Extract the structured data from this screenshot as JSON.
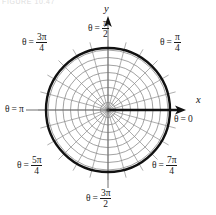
{
  "figure": {
    "title_fragment": "FIGURE 10.47",
    "colors": {
      "grid": "#8a8a8a",
      "bold_curve": "#111111",
      "axis": "#111111",
      "background": "#ffffff",
      "text": "#1a1a1a"
    }
  },
  "axes": {
    "x_letter": "x",
    "y_letter": "y"
  },
  "labels": {
    "theta_symbol": "θ",
    "equals": "=",
    "pi": "π",
    "theta_0": {
      "name": "theta-zero",
      "value": "0",
      "kind": "plain"
    },
    "theta_pi_over_4": {
      "name": "theta-pi-over-4",
      "num": "π",
      "den": "4",
      "kind": "fraction"
    },
    "theta_pi_over_2": {
      "name": "theta-pi-over-2",
      "num": "π",
      "den": "2",
      "kind": "fraction"
    },
    "theta_3pi_over_4": {
      "name": "theta-three-pi-over-4",
      "num": "3π",
      "den": "4",
      "kind": "fraction"
    },
    "theta_pi": {
      "name": "theta-pi",
      "value": "π",
      "kind": "plain"
    },
    "theta_5pi_over_4": {
      "name": "theta-five-pi-over-4",
      "num": "5π",
      "den": "4",
      "kind": "fraction"
    },
    "theta_3pi_over_2": {
      "name": "theta-three-pi-over-2",
      "num": "3π",
      "den": "2",
      "kind": "fraction"
    },
    "theta_7pi_over_4": {
      "name": "theta-seven-pi-over-4",
      "num": "7π",
      "den": "4",
      "kind": "fraction"
    }
  },
  "chart_data": {
    "type": "line",
    "subtype": "polar-grid",
    "title": "",
    "xlabel": "x",
    "ylabel": "y",
    "center": {
      "x": 108,
      "y": 110
    },
    "grid": true,
    "legend": "none",
    "radial_gridlines": {
      "count": 8,
      "radii_px": [
        7.5,
        15,
        22.5,
        30,
        37.5,
        45,
        52.5,
        60
      ],
      "color": "#8a8a8a"
    },
    "angular_gridlines": {
      "count": 24,
      "step_degrees": 15,
      "outer_radius_px": 70,
      "color": "#8a8a8a"
    },
    "series": [
      {
        "name": "r = constant circle",
        "type": "circle",
        "radius_px": 62,
        "color": "#111111",
        "linewidth_px": 2.4
      }
    ],
    "angle_ticks_labeled": [
      {
        "label": "θ = 0",
        "degrees": 0,
        "radians": 0
      },
      {
        "label": "θ = π/4",
        "degrees": 45,
        "radians": 0.7854
      },
      {
        "label": "θ = π/2",
        "degrees": 90,
        "radians": 1.5708
      },
      {
        "label": "θ = 3π/4",
        "degrees": 135,
        "radians": 2.3562
      },
      {
        "label": "θ = π",
        "degrees": 180,
        "radians": 3.1416
      },
      {
        "label": "θ = 5π/4",
        "degrees": 225,
        "radians": 3.927
      },
      {
        "label": "θ = 3π/2",
        "degrees": 270,
        "radians": 4.7124
      },
      {
        "label": "θ = 7π/4",
        "degrees": 315,
        "radians": 5.4978
      }
    ]
  }
}
